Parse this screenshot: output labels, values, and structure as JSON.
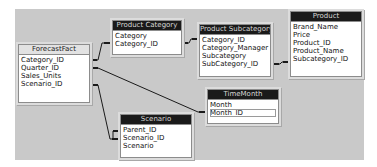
{
  "diagram": {
    "tables": [
      {
        "id": "forecastfact",
        "name": "ForecastFact",
        "active": false,
        "fields": [
          "Category_ID",
          "Quarter_ID",
          "Sales_Units",
          "Scenario_ID"
        ]
      },
      {
        "id": "product-category",
        "name": "Product Category",
        "active": true,
        "fields": [
          "Category",
          "Category_ID"
        ]
      },
      {
        "id": "product-subcategory",
        "name": "Product Subcategory",
        "active": true,
        "fields": [
          "Category_ID",
          "Category_Manager",
          "Subcategory",
          "SubCategory_ID"
        ]
      },
      {
        "id": "product",
        "name": "Product",
        "active": true,
        "fields": [
          "Brand_Name",
          "Price",
          "Product_ID",
          "Product_Name",
          "Subcategory_ID"
        ]
      },
      {
        "id": "timemonth",
        "name": "TimeMonth",
        "active": true,
        "fields": [
          "Month",
          "Month_ID"
        ],
        "focused_field": "Month_ID"
      },
      {
        "id": "scenario",
        "name": "Scenario",
        "active": true,
        "fields": [
          "Parent_ID",
          "Scenario_ID",
          "Scenario"
        ]
      }
    ],
    "relationships": [
      {
        "from": "ForecastFact.Category_ID",
        "to": "Product Category.Category_ID"
      },
      {
        "from": "Product Category.Category_ID",
        "to": "Product Subcategory.Category_ID"
      },
      {
        "from": "Product Subcategory.SubCategory_ID",
        "to": "Product.Subcategory_ID"
      },
      {
        "from": "ForecastFact.Quarter_ID",
        "to": "TimeMonth.Month_ID"
      },
      {
        "from": "ForecastFact.Scenario_ID",
        "to": "Scenario.Scenario_ID"
      },
      {
        "from": "Scenario.Parent_ID",
        "to": "Scenario.Scenario_ID"
      }
    ],
    "colors": {
      "canvas": "#c9c9c9",
      "title_active": "#1a1a1a",
      "title_inactive": "#e2e2e2",
      "line": "#1a1a1a"
    }
  }
}
